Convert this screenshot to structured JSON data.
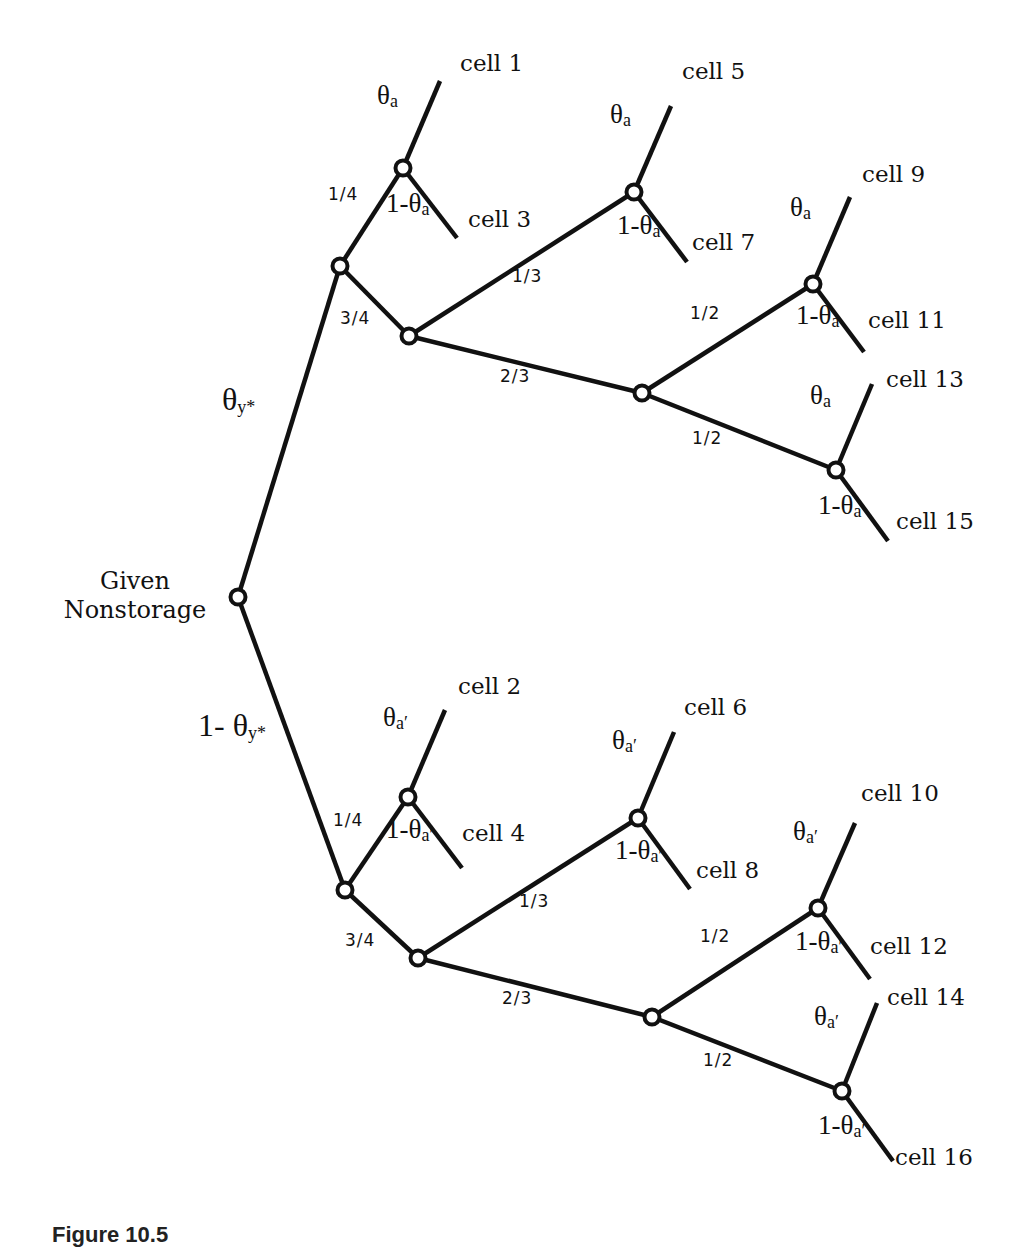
{
  "figure": {
    "caption": "Figure 10.5",
    "root_label": [
      "Given",
      "Nonstorage"
    ]
  },
  "tree": {
    "nodes": [
      {
        "id": "root",
        "x": 238,
        "y": 597
      },
      {
        "id": "u1",
        "x": 340,
        "y": 266
      },
      {
        "id": "u_a1",
        "x": 403,
        "y": 168
      },
      {
        "id": "u2",
        "x": 409,
        "y": 336
      },
      {
        "id": "u_a2",
        "x": 634,
        "y": 192
      },
      {
        "id": "u3",
        "x": 642,
        "y": 393
      },
      {
        "id": "u_a3",
        "x": 813,
        "y": 284
      },
      {
        "id": "u_a4",
        "x": 836,
        "y": 470
      },
      {
        "id": "l1",
        "x": 345,
        "y": 890
      },
      {
        "id": "l_a1",
        "x": 408,
        "y": 797
      },
      {
        "id": "l2",
        "x": 418,
        "y": 958
      },
      {
        "id": "l_a2",
        "x": 638,
        "y": 818
      },
      {
        "id": "l3",
        "x": 652,
        "y": 1017
      },
      {
        "id": "l_a3",
        "x": 818,
        "y": 908
      },
      {
        "id": "l_a4",
        "x": 842,
        "y": 1091
      }
    ],
    "edges": [
      {
        "from": "root",
        "to": "u1"
      },
      {
        "from": "root",
        "to": "l1"
      },
      {
        "from": "u1",
        "to": "u_a1"
      },
      {
        "from": "u1",
        "to": "u2"
      },
      {
        "from": "u2",
        "to": "u_a2"
      },
      {
        "from": "u2",
        "to": "u3"
      },
      {
        "from": "u3",
        "to": "u_a3"
      },
      {
        "from": "u3",
        "to": "u_a4"
      },
      {
        "from": "l1",
        "to": "l_a1"
      },
      {
        "from": "l1",
        "to": "l2"
      },
      {
        "from": "l2",
        "to": "l_a2"
      },
      {
        "from": "l2",
        "to": "l3"
      },
      {
        "from": "l3",
        "to": "l_a3"
      },
      {
        "from": "l3",
        "to": "l_a4"
      }
    ],
    "leaves": [
      {
        "from": "u_a1",
        "x": 440,
        "y": 81
      },
      {
        "from": "u_a1",
        "x": 457,
        "y": 238
      },
      {
        "from": "u_a2",
        "x": 671,
        "y": 106
      },
      {
        "from": "u_a2",
        "x": 687,
        "y": 262
      },
      {
        "from": "u_a3",
        "x": 850,
        "y": 197
      },
      {
        "from": "u_a3",
        "x": 864,
        "y": 352
      },
      {
        "from": "u_a4",
        "x": 872,
        "y": 384
      },
      {
        "from": "u_a4",
        "x": 888,
        "y": 541
      },
      {
        "from": "l_a1",
        "x": 445,
        "y": 710
      },
      {
        "from": "l_a1",
        "x": 462,
        "y": 868
      },
      {
        "from": "l_a2",
        "x": 674,
        "y": 732
      },
      {
        "from": "l_a2",
        "x": 690,
        "y": 889
      },
      {
        "from": "l_a3",
        "x": 855,
        "y": 823
      },
      {
        "from": "l_a3",
        "x": 870,
        "y": 979
      },
      {
        "from": "l_a4",
        "x": 877,
        "y": 1003
      },
      {
        "from": "l_a4",
        "x": 893,
        "y": 1161
      }
    ]
  },
  "cells": [
    {
      "text": "cell 1",
      "x": 460,
      "y": 66
    },
    {
      "text": "cell 3",
      "x": 468,
      "y": 222
    },
    {
      "text": "cell 5",
      "x": 682,
      "y": 74
    },
    {
      "text": "cell 7",
      "x": 692,
      "y": 245
    },
    {
      "text": "cell 9",
      "x": 862,
      "y": 177
    },
    {
      "text": "cell 11",
      "x": 868,
      "y": 323
    },
    {
      "text": "cell 13",
      "x": 886,
      "y": 382
    },
    {
      "text": "cell 15",
      "x": 896,
      "y": 524
    },
    {
      "text": "cell 2",
      "x": 458,
      "y": 689
    },
    {
      "text": "cell 4",
      "x": 462,
      "y": 836
    },
    {
      "text": "cell 6",
      "x": 684,
      "y": 710
    },
    {
      "text": "cell 8",
      "x": 696,
      "y": 873
    },
    {
      "text": "cell 10",
      "x": 861,
      "y": 796
    },
    {
      "text": "cell 12",
      "x": 870,
      "y": 949
    },
    {
      "text": "cell 14",
      "x": 887,
      "y": 1000
    },
    {
      "text": "cell 16",
      "x": 895,
      "y": 1160
    }
  ],
  "probabilities": [
    {
      "text": "1/4",
      "x": 328,
      "y": 196
    },
    {
      "text": "3/4",
      "x": 340,
      "y": 320
    },
    {
      "text": "1/3",
      "x": 512,
      "y": 278
    },
    {
      "text": "2/3",
      "x": 500,
      "y": 378
    },
    {
      "text": "1/2",
      "x": 690,
      "y": 315
    },
    {
      "text": "1/2",
      "x": 692,
      "y": 440
    },
    {
      "text": "1/4",
      "x": 333,
      "y": 822
    },
    {
      "text": "3/4",
      "x": 345,
      "y": 942
    },
    {
      "text": "1/3",
      "x": 519,
      "y": 903
    },
    {
      "text": "2/3",
      "x": 502,
      "y": 1000
    },
    {
      "text": "1/2",
      "x": 700,
      "y": 938
    },
    {
      "text": "1/2",
      "x": 703,
      "y": 1062
    }
  ],
  "thetas": [
    {
      "prefix": "",
      "sub": "y*",
      "x": 222,
      "y": 401,
      "size": 32
    },
    {
      "prefix": "1- ",
      "sub": "y*",
      "x": 198,
      "y": 727,
      "size": 32
    },
    {
      "prefix": "",
      "sub": "a",
      "x": 377,
      "y": 100
    },
    {
      "prefix": "1-",
      "sub": "a",
      "x": 386,
      "y": 208
    },
    {
      "prefix": "",
      "sub": "a",
      "x": 610,
      "y": 119
    },
    {
      "prefix": "1-",
      "sub": "a",
      "x": 617,
      "y": 230
    },
    {
      "prefix": "",
      "sub": "a",
      "x": 790,
      "y": 212
    },
    {
      "prefix": "1-",
      "sub": "a",
      "x": 796,
      "y": 320
    },
    {
      "prefix": "",
      "sub": "a",
      "x": 810,
      "y": 400
    },
    {
      "prefix": "1-",
      "sub": "a",
      "x": 818,
      "y": 510
    },
    {
      "prefix": "",
      "sub": "a′",
      "x": 383,
      "y": 722
    },
    {
      "prefix": "1-",
      "sub": "a′",
      "x": 386,
      "y": 834
    },
    {
      "prefix": "",
      "sub": "a′",
      "x": 612,
      "y": 745
    },
    {
      "prefix": "1-",
      "sub": "a′",
      "x": 615,
      "y": 855
    },
    {
      "prefix": "",
      "sub": "a′",
      "x": 793,
      "y": 836
    },
    {
      "prefix": "1-",
      "sub": "a′",
      "x": 795,
      "y": 946
    },
    {
      "prefix": "",
      "sub": "a′",
      "x": 814,
      "y": 1021
    },
    {
      "prefix": "1-",
      "sub": "a′",
      "x": 818,
      "y": 1130
    }
  ],
  "style": {
    "line_color": "#111111",
    "background": "#ffffff"
  }
}
